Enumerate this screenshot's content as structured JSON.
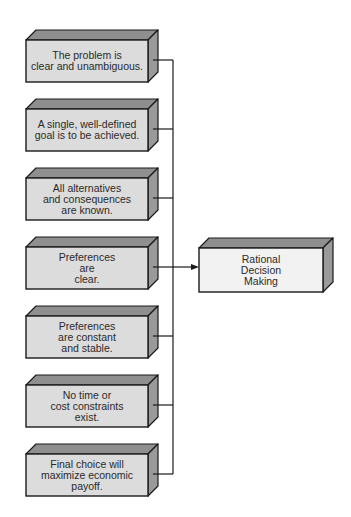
{
  "diagram": {
    "conditions": [
      {
        "text": "The problem is\nclear and unambiguous."
      },
      {
        "text": "A single, well-defined\ngoal is to be achieved."
      },
      {
        "text": "All alternatives\nand consequences\nare known."
      },
      {
        "text": "Preferences\nare\nclear."
      },
      {
        "text": "Preferences\nare constant\nand stable."
      },
      {
        "text": "No time or\ncost constraints\nexist."
      },
      {
        "text": "Final choice will\nmaximize economic\npayoff."
      }
    ],
    "outcome": {
      "text": "Rational\nDecision\nMaking"
    },
    "colors": {
      "front_face": "#dcdcdc",
      "top_face": "#8f8f8f",
      "side_face": "#9a9a9a",
      "outcome_front": "#f2f2f2",
      "outline": "#1a1a1a",
      "connector": "#1a1a1a"
    }
  }
}
